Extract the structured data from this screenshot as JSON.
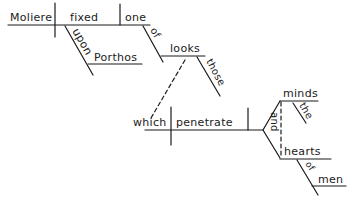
{
  "diagram": {
    "type": "sentence-diagram",
    "sentence": "Moliere fixed upon Porthos one of those looks which penetrate the minds and hearts of men",
    "words": {
      "subject": "Moliere",
      "verb": "fixed",
      "verb_modifier": "upon",
      "verb_modifier_object": "Porthos",
      "direct_object": "one",
      "object_modifier": "of",
      "prep_object": "looks",
      "prep_object_modifier": "those",
      "relative_subject": "which",
      "relative_verb": "penetrate",
      "compound_object_1": "minds",
      "compound_object_1_modifier": "the",
      "conjunction": "and",
      "compound_object_2": "hearts",
      "compound_object_2_modifier": "of",
      "compound_object_2_prep_object": "men"
    },
    "colors": {
      "ink": "#1a1a1a",
      "background": "#ffffff"
    }
  }
}
